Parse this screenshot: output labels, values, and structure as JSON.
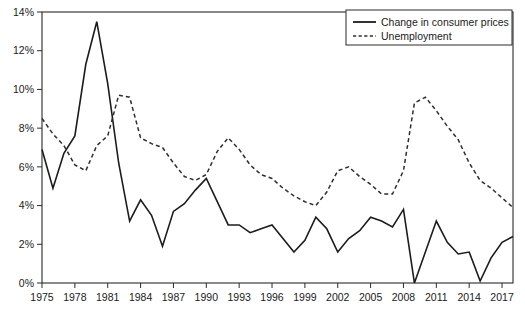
{
  "chart_data": {
    "type": "line",
    "title": "",
    "subtitle": "",
    "xlabel": "",
    "ylabel": "",
    "xlim": [
      1975,
      2018
    ],
    "ylim": [
      0,
      14
    ],
    "ytick_labels": [
      "0%",
      "2%",
      "4%",
      "6%",
      "8%",
      "10%",
      "12%",
      "14%"
    ],
    "ytick_values": [
      0,
      2,
      4,
      6,
      8,
      10,
      12,
      14
    ],
    "xtick_labels": [
      "1975",
      "1978",
      "1981",
      "1984",
      "1987",
      "1990",
      "1993",
      "1996",
      "1999",
      "2002",
      "2005",
      "2008",
      "2011",
      "2014",
      "2017"
    ],
    "xtick_values": [
      1975,
      1978,
      1981,
      1984,
      1987,
      1990,
      1993,
      1996,
      1999,
      2002,
      2005,
      2008,
      2011,
      2014,
      2017
    ],
    "grid": false,
    "legend_position": "top-right",
    "x": [
      1975,
      1976,
      1977,
      1978,
      1979,
      1980,
      1981,
      1982,
      1983,
      1984,
      1985,
      1986,
      1987,
      1988,
      1989,
      1990,
      1991,
      1992,
      1993,
      1994,
      1995,
      1996,
      1997,
      1998,
      1999,
      2000,
      2001,
      2002,
      2003,
      2004,
      2005,
      2006,
      2007,
      2008,
      2009,
      2010,
      2011,
      2012,
      2013,
      2014,
      2015,
      2016,
      2017,
      2018
    ],
    "series": [
      {
        "name": "Change in consumer prices",
        "style": "solid",
        "color": "#1c1c1c",
        "values": [
          6.9,
          4.9,
          6.7,
          7.6,
          11.3,
          13.5,
          10.3,
          6.2,
          3.2,
          4.3,
          3.5,
          1.9,
          3.7,
          4.1,
          4.8,
          5.4,
          4.2,
          3.0,
          3.0,
          2.6,
          2.8,
          3.0,
          2.3,
          1.6,
          2.2,
          3.4,
          2.8,
          1.6,
          2.3,
          2.7,
          3.4,
          3.2,
          2.9,
          3.8,
          -0.4,
          1.6,
          3.2,
          2.1,
          1.5,
          1.6,
          0.1,
          1.3,
          2.1,
          2.4
        ]
      },
      {
        "name": "Unemployment",
        "style": "dashed",
        "color": "#2e2e2e",
        "values": [
          8.5,
          7.7,
          7.1,
          6.1,
          5.8,
          7.1,
          7.6,
          9.7,
          9.6,
          7.5,
          7.2,
          7.0,
          6.2,
          5.5,
          5.3,
          5.6,
          6.8,
          7.5,
          6.9,
          6.1,
          5.6,
          5.4,
          4.9,
          4.5,
          4.2,
          4.0,
          4.7,
          5.8,
          6.0,
          5.5,
          5.1,
          4.6,
          4.6,
          5.8,
          9.3,
          9.6,
          8.9,
          8.1,
          7.4,
          6.2,
          5.3,
          4.9,
          4.4,
          3.9
        ]
      }
    ]
  },
  "legend": {
    "items": [
      {
        "label": "Change in consumer prices",
        "style": "solid"
      },
      {
        "label": "Unemployment",
        "style": "dashed"
      }
    ]
  }
}
